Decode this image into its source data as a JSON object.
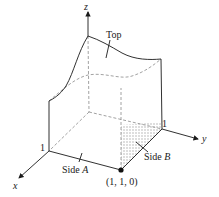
{
  "diagram": {
    "title": "",
    "axes": {
      "x_label": "x",
      "y_label": "y",
      "z_label": "z",
      "x_tick": "1",
      "y_tick": "1"
    },
    "labels": {
      "top": "Top",
      "side_a_word": "Side",
      "side_a_letter": "A",
      "side_b_word": "Side",
      "side_b_letter": "B",
      "point": "(1, 1, 0)"
    },
    "colors": {
      "line": "#1a1a1a",
      "hidden": "#888888",
      "shade": "#b5b5b5"
    }
  }
}
